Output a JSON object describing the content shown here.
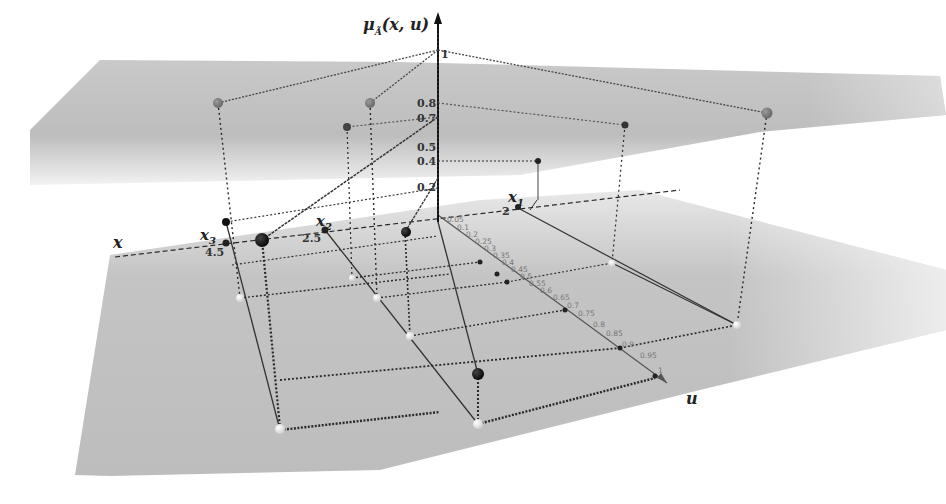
{
  "diagram": {
    "type": "3d-type2-fuzzy-set-visualization",
    "z_axis": {
      "label": "μ_Ã(x,u)",
      "label_main": "μ",
      "label_sub": "Ã",
      "label_args": "(x, u)",
      "ticks": [
        "1",
        "0.8",
        "0.7",
        "0.5",
        "0.4",
        "0.2"
      ]
    },
    "x_axis": {
      "label": "x",
      "points": [
        {
          "name": "x1",
          "main": "x",
          "sub": "1",
          "value": "2"
        },
        {
          "name": "x2",
          "main": "x",
          "sub": "2",
          "value": "2.5"
        },
        {
          "name": "x3",
          "main": "x",
          "sub": "3",
          "value": "4.5"
        }
      ]
    },
    "u_axis": {
      "label": "u",
      "ticks": [
        "0.05",
        "0.1",
        "0.2",
        "0.25",
        "0.3",
        "0.35",
        "0.4",
        "0.45",
        "0.5",
        "0.55",
        "0.6",
        "0.65",
        "0.7",
        "0.75",
        "0.8",
        "0.85",
        "0.9",
        "0.95",
        "1"
      ]
    },
    "planes": {
      "upper": "μ = 1 plane (grey, translucent)",
      "lower": "μ = 0 plane (grey, translucent)"
    },
    "colors": {
      "plane": "#b8b8b8",
      "line": "#333333",
      "point_dark": "#111111",
      "point_grey": "#7a7a7a",
      "point_light": "#e6e6e6"
    }
  }
}
